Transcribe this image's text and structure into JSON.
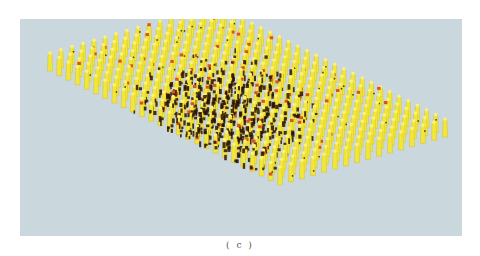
{
  "figure": {
    "caption": "( c )",
    "background_color": "#cad7dc",
    "element_color": "#f2e63a",
    "highlight_color": "#e0501e",
    "cluster_color": "#2a1208"
  }
}
